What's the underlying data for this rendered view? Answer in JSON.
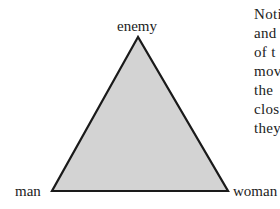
{
  "diagram": {
    "type": "triangle",
    "fill_color": "#d3d3d3",
    "stroke_color": "#1a1a1a",
    "vertices": {
      "top": {
        "label": "enemy"
      },
      "bottom_left": {
        "label": "man"
      },
      "bottom_right": {
        "label": "woman"
      }
    }
  },
  "paragraph": {
    "lines": [
      "Noti",
      "and",
      "of t",
      "mov",
      "the",
      "clos",
      "they"
    ]
  }
}
